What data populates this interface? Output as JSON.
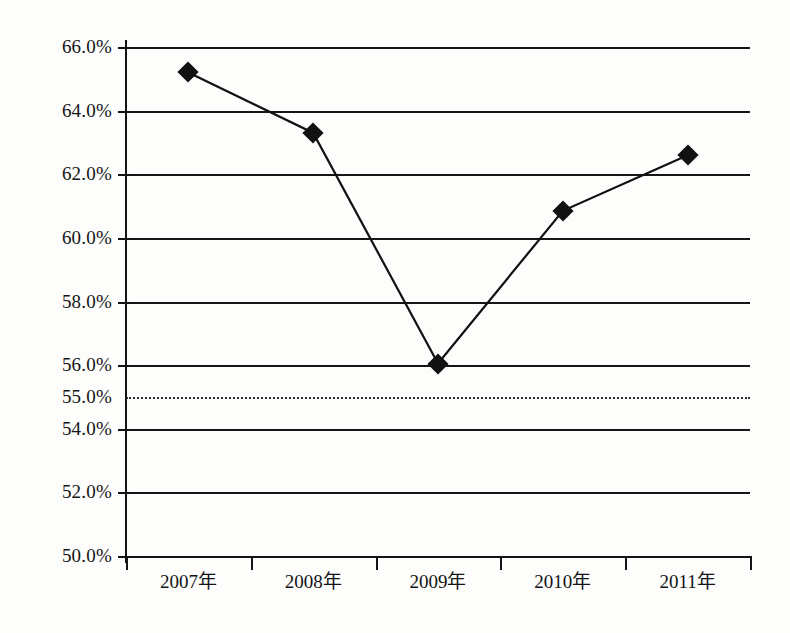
{
  "chart_data": {
    "type": "line",
    "title": "",
    "subtitle": "",
    "xlabel": "",
    "ylabel": "",
    "categories": [
      "2007年",
      "2008年",
      "2009年",
      "2010年",
      "2011年"
    ],
    "values": [
      65.2,
      63.3,
      56.05,
      60.85,
      62.6
    ],
    "value_labels": [
      "65.2%",
      "63.3%",
      "56.0%",
      "60.9%",
      "62.6%"
    ],
    "series": [
      {
        "name": "",
        "values": [
          65.2,
          63.3,
          56.05,
          60.85,
          62.6
        ],
        "marker": "diamond",
        "marker_color": "#111111",
        "line_color": "#111111"
      }
    ],
    "ylim": [
      50.0,
      66.0
    ],
    "ytick_values": [
      66.0,
      64.0,
      62.0,
      60.0,
      58.0,
      56.0,
      55.0,
      54.0,
      52.0,
      50.0
    ],
    "ytick_labels": [
      "66.0%",
      "64.0%",
      "62.0%",
      "60.0%",
      "58.0%",
      "56.0%",
      "55.0%",
      "54.0%",
      "52.0%",
      "50.0%"
    ],
    "grid": true,
    "grid_axis": "y",
    "reference_line": {
      "value": 55.0,
      "label": "55.0%",
      "style": "dotted"
    },
    "legend": null,
    "legend_position": "none",
    "annotations": []
  },
  "axes": {
    "y": {
      "ticks": [
        {
          "label": "66.0%",
          "value": 66.0,
          "grid_style": "solid"
        },
        {
          "label": "64.0%",
          "value": 64.0,
          "grid_style": "solid"
        },
        {
          "label": "62.0%",
          "value": 62.0,
          "grid_style": "solid"
        },
        {
          "label": "60.0%",
          "value": 60.0,
          "grid_style": "solid"
        },
        {
          "label": "58.0%",
          "value": 58.0,
          "grid_style": "solid"
        },
        {
          "label": "56.0%",
          "value": 56.0,
          "grid_style": "solid"
        },
        {
          "label": "55.0%",
          "value": 55.0,
          "grid_style": "dotted"
        },
        {
          "label": "54.0%",
          "value": 54.0,
          "grid_style": "solid"
        },
        {
          "label": "52.0%",
          "value": 52.0,
          "grid_style": "solid"
        },
        {
          "label": "50.0%",
          "value": 50.0,
          "grid_style": "solid"
        }
      ]
    },
    "x": {
      "ticks": [
        "2007年",
        "2008年",
        "2009年",
        "2010年",
        "2011年"
      ]
    }
  },
  "colors": {
    "background": "#fdfdfc",
    "axis": "#141414",
    "grid": "#161616",
    "series": "#111111",
    "reference": "#2a2a2a"
  }
}
